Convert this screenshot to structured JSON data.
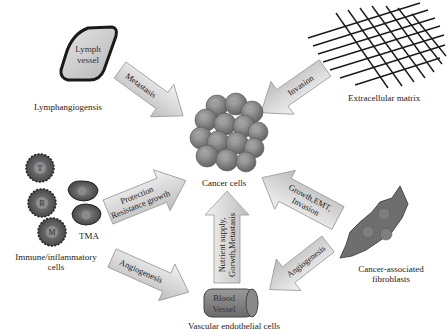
{
  "diagram": {
    "center": {
      "label": "Cancer cells"
    },
    "nodes": {
      "lymph_vessel": {
        "shape_text_line1": "Lymph",
        "shape_text_line2": "vessel",
        "label": "Lymphangiogensis"
      },
      "ecm": {
        "label": "Extracellular matrix"
      },
      "immune": {
        "label_line1": "Immune/inflammatory",
        "label_line2": "cells",
        "tma_label": "TMA",
        "cells": [
          "T",
          "B",
          "M"
        ]
      },
      "caf": {
        "label_line1": "Cancer-associated",
        "label_line2": "fibroblasts"
      },
      "vessel": {
        "shape_text_line1": "Blood",
        "shape_text_line2": "Vessel",
        "label": "Vascular endothelial cells"
      }
    },
    "arrows": {
      "metastasis": "Metastasis",
      "invasion": "Invasion",
      "protection_line1": "Protection",
      "protection_line2": "Resistance growth",
      "caf_to_cancer_line1": "Growth,EMT,",
      "caf_to_cancer_line2": "Invasion",
      "vessel_to_cancer_line1": "Nutrient supply,",
      "vessel_to_cancer_line2": "Gorwth,Metastasis",
      "immune_angiogenesis": "Angiogenesis",
      "caf_angiogenesis": "Angiogenesis"
    },
    "colors": {
      "arrow_fill": "#d9d9d9",
      "arrow_stroke": "#9a9a9a",
      "cell_fill": "#7a7a7a",
      "cell_dark": "#4a4a4a",
      "background": "#ffffff"
    }
  }
}
